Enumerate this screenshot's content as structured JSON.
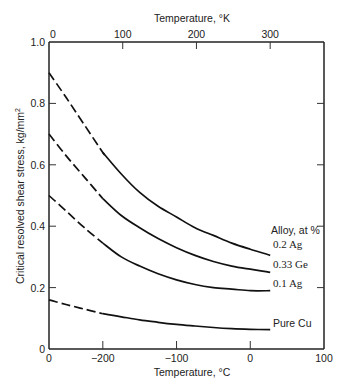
{
  "chart_data": {
    "type": "line",
    "title": "",
    "xlabel": "Temperature, °C",
    "x2label": "Temperature, °K",
    "ylabel": "Critical resolved shear stress, kg/mm²",
    "xlim": [
      -273,
      100
    ],
    "ylim": [
      0,
      1.0
    ],
    "x_ticks": [
      "0",
      "-200",
      "-100",
      "0",
      "100"
    ],
    "x_tick_values": [
      -273,
      -200,
      -100,
      0,
      100
    ],
    "x2_ticks": [
      "0",
      "100",
      "200",
      "300"
    ],
    "x2_tick_values": [
      0,
      100,
      200,
      300
    ],
    "y_ticks": [
      "0",
      "0.2",
      "0.4",
      "0.6",
      "0.8",
      "1.0"
    ],
    "y_tick_values": [
      0,
      0.2,
      0.4,
      0.6,
      0.8,
      1.0
    ],
    "grid": false,
    "legend_title": "Alloy, at %",
    "series": [
      {
        "name": "0.2 Ag",
        "x": [
          -273,
          -250,
          -225,
          -200,
          -175,
          -150,
          -125,
          -100,
          -75,
          -50,
          -25,
          0,
          27
        ],
        "y": [
          0.9,
          0.82,
          0.73,
          0.64,
          0.57,
          0.51,
          0.465,
          0.43,
          0.395,
          0.37,
          0.345,
          0.325,
          0.305
        ],
        "dashed_below": -180
      },
      {
        "name": "0.33 Ge",
        "x": [
          -273,
          -250,
          -225,
          -200,
          -175,
          -150,
          -125,
          -100,
          -75,
          -50,
          -25,
          0,
          27
        ],
        "y": [
          0.7,
          0.63,
          0.56,
          0.49,
          0.435,
          0.395,
          0.36,
          0.33,
          0.305,
          0.285,
          0.27,
          0.26,
          0.25
        ],
        "dashed_below": -200
      },
      {
        "name": "0.1 Ag",
        "x": [
          -273,
          -250,
          -225,
          -200,
          -175,
          -150,
          -125,
          -100,
          -75,
          -50,
          -25,
          0,
          27
        ],
        "y": [
          0.5,
          0.45,
          0.395,
          0.345,
          0.3,
          0.27,
          0.245,
          0.225,
          0.21,
          0.2,
          0.195,
          0.19,
          0.19
        ],
        "dashed_below": -200
      },
      {
        "name": "Pure Cu",
        "x": [
          -273,
          -250,
          -225,
          -200,
          -175,
          -150,
          -125,
          -100,
          -75,
          -50,
          -25,
          0,
          27
        ],
        "y": [
          0.16,
          0.145,
          0.13,
          0.115,
          0.105,
          0.095,
          0.087,
          0.08,
          0.075,
          0.07,
          0.066,
          0.064,
          0.063
        ],
        "dashed_below": -200
      }
    ]
  },
  "labels": {
    "top_axis_title": "Temperature, °K",
    "bottom_axis_title": "Temperature, °C",
    "y_axis_title": "Critical resolved shear stress, kg/mm",
    "y_axis_title_sup": "2",
    "legend_title": "Alloy, at %",
    "series_labels": [
      "0.2 Ag",
      "0.33 Ge",
      "0.1 Ag",
      "Pure Cu"
    ]
  }
}
